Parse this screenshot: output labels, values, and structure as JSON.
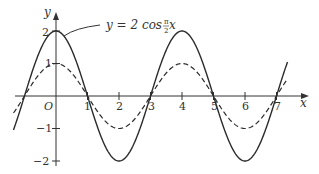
{
  "chart_data": {
    "type": "line",
    "title": "",
    "xlabel": "x",
    "ylabel": "y",
    "origin_label": "O",
    "xlim": [
      -1.35,
      7.35
    ],
    "ylim": [
      -2,
      2
    ],
    "x_ticks": [
      1,
      2,
      3,
      4,
      5,
      6,
      7
    ],
    "x_tick_labels": [
      "1",
      "2",
      "3",
      "4",
      "5",
      "6",
      "7"
    ],
    "y_ticks": [
      2,
      1,
      -1,
      -2
    ],
    "y_tick_labels": [
      "2",
      "1",
      "−1",
      "−2"
    ],
    "grid": false,
    "legend": null,
    "annotations": [
      {
        "text": "y = 2 cos π/2 x",
        "points_to": "solid curve near x≈0.35, y≈1.9"
      }
    ],
    "series": [
      {
        "name": "y = 2 cos (π/2) x",
        "style": "solid",
        "amplitude": 2,
        "x": [
          -1.35,
          -1,
          0,
          1,
          2,
          3,
          4,
          5,
          6,
          7,
          7.35
        ],
        "values": [
          -1.04,
          0,
          2,
          0,
          -2,
          0,
          2,
          0,
          -2,
          0,
          1.04
        ]
      },
      {
        "name": "y = cos (π/2) x",
        "style": "dashed",
        "amplitude": 1,
        "x": [
          -1.35,
          -1,
          0,
          1,
          2,
          3,
          4,
          5,
          6,
          7,
          7.35
        ],
        "values": [
          -0.52,
          0,
          1,
          0,
          -1,
          0,
          1,
          0,
          -1,
          0,
          0.52
        ]
      }
    ]
  },
  "labels": {
    "x_axis": "x",
    "y_axis": "y",
    "origin": "O",
    "annotation_lhs": "y = 2 cos ",
    "annotation_frac_num": "π",
    "annotation_frac_den": "2",
    "annotation_rhs": " x",
    "x_ticks": [
      "1",
      "2",
      "3",
      "4",
      "5",
      "6",
      "7"
    ],
    "y_ticks": {
      "p2": "2",
      "p1": "1",
      "m1": "−1",
      "m2": "−2"
    }
  },
  "colors": {
    "ink": "#2b2b2b",
    "background": "#ffffff"
  }
}
